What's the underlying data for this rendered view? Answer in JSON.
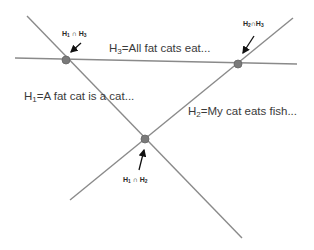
{
  "diagram": {
    "lines": {
      "h1": {
        "name": "H1",
        "x1": 27,
        "y1": 16,
        "x2": 242,
        "y2": 238
      },
      "h2": {
        "name": "H2",
        "x1": 70,
        "y1": 200,
        "x2": 293,
        "y2": 18
      },
      "h3": {
        "name": "H3",
        "x1": 15,
        "y1": 58,
        "x2": 297,
        "y2": 64
      }
    },
    "line_color": "#8a8a8a",
    "point_color": "#7a7a7a",
    "labels": {
      "h3": {
        "prefix": "H",
        "sub": "3",
        "text": "=All fat cats eat..."
      },
      "h1": {
        "prefix": "H",
        "sub": "1",
        "text": "=A fat cat is a cat..."
      },
      "h2": {
        "prefix": "H",
        "sub": "2",
        "text": "=My cat eats fish..."
      }
    },
    "intersections": {
      "h1_h3": {
        "a": "H",
        "a_sub": "1",
        "op": " ∩ ",
        "b": "H",
        "b_sub": "3",
        "x": 66,
        "y": 60
      },
      "h2_h3": {
        "a": "H",
        "a_sub": "2",
        "op": "∩",
        "b": "H",
        "b_sub": "3",
        "x": 238,
        "y": 64
      },
      "h1_h2": {
        "a": "H",
        "a_sub": "1",
        "op": " ∩ ",
        "b": "H",
        "b_sub": "2",
        "x": 145,
        "y": 139
      }
    }
  }
}
